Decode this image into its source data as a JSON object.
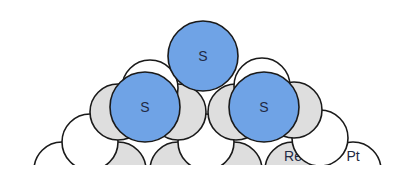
{
  "diagram": {
    "title": "",
    "colors": {
      "sulfur": "#6fa3e6",
      "rhenium": "#dedede",
      "platinum": "#ffffff",
      "stroke": "#1a1a1a",
      "text": "#1f2a44"
    },
    "legend_labels": {
      "rhenium": "Re",
      "platinum": "Pt"
    },
    "atoms": [
      {
        "id": "bottom-1",
        "element": "Pt",
        "cx": 62,
        "cy": 170,
        "r": 28,
        "label": ""
      },
      {
        "id": "bottom-2",
        "element": "Re",
        "cx": 118,
        "cy": 170,
        "r": 28,
        "label": ""
      },
      {
        "id": "bottom-3",
        "element": "Re",
        "cx": 178,
        "cy": 170,
        "r": 28,
        "label": ""
      },
      {
        "id": "bottom-4",
        "element": "Re",
        "cx": 234,
        "cy": 170,
        "r": 28,
        "label": ""
      },
      {
        "id": "bottom-5",
        "element": "Re",
        "cx": 293,
        "cy": 170,
        "r": 28,
        "label": "Re"
      },
      {
        "id": "bottom-6",
        "element": "Pt",
        "cx": 353,
        "cy": 170,
        "r": 28,
        "label": "Pt"
      },
      {
        "id": "row2-1",
        "element": "Pt",
        "cx": 90,
        "cy": 142,
        "r": 28,
        "label": ""
      },
      {
        "id": "row2-2",
        "element": "Pt",
        "cx": 206,
        "cy": 142,
        "r": 28,
        "label": ""
      },
      {
        "id": "row2-3",
        "element": "Pt",
        "cx": 320,
        "cy": 138,
        "r": 28,
        "label": ""
      },
      {
        "id": "row3-1",
        "element": "Re",
        "cx": 118,
        "cy": 112,
        "r": 28,
        "label": ""
      },
      {
        "id": "row3-2",
        "element": "Re",
        "cx": 178,
        "cy": 112,
        "r": 28,
        "label": ""
      },
      {
        "id": "row3-3",
        "element": "Re",
        "cx": 236,
        "cy": 112,
        "r": 28,
        "label": ""
      },
      {
        "id": "row3-4",
        "element": "Re",
        "cx": 294,
        "cy": 110,
        "r": 28,
        "label": ""
      },
      {
        "id": "row4-1",
        "element": "Pt",
        "cx": 150,
        "cy": 88,
        "r": 28,
        "label": ""
      },
      {
        "id": "row4-2",
        "element": "Pt",
        "cx": 262,
        "cy": 86,
        "r": 28,
        "label": ""
      },
      {
        "id": "s-left",
        "element": "S",
        "cx": 145,
        "cy": 107,
        "r": 35,
        "label": "S"
      },
      {
        "id": "s-right",
        "element": "S",
        "cx": 264,
        "cy": 107,
        "r": 35,
        "label": "S"
      },
      {
        "id": "s-top",
        "element": "S",
        "cx": 203,
        "cy": 56,
        "r": 35,
        "label": "S"
      }
    ]
  }
}
